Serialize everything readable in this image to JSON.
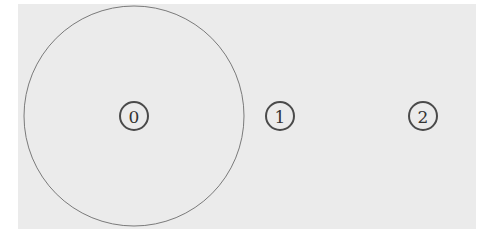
{
  "diagram": {
    "background": "#ebebeb",
    "panel": {
      "x": 18,
      "y": 4,
      "width": 458,
      "height": 225
    },
    "coverage_circle": {
      "cx": 134,
      "cy": 116,
      "r": 110,
      "stroke": "#7a7a7a"
    },
    "nodes": [
      {
        "id": "0",
        "label": "0",
        "cx": 134,
        "cy": 116,
        "r": 14
      },
      {
        "id": "1",
        "label": "1",
        "cx": 280,
        "cy": 116,
        "r": 14
      },
      {
        "id": "2",
        "label": "2",
        "cx": 423,
        "cy": 116,
        "r": 14
      }
    ]
  }
}
